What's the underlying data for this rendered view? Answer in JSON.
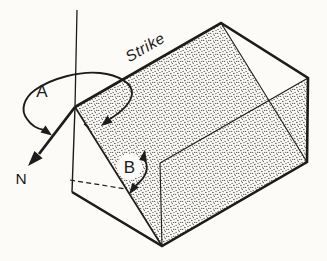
{
  "figure": {
    "labels": {
      "strike": "Strike",
      "angle_a": "A",
      "angle_b": "B",
      "north": "N"
    },
    "colors": {
      "ink": "#1c1c1c",
      "paper": "#fcfbf8",
      "stipple_dot": "#2f2f2f"
    }
  }
}
